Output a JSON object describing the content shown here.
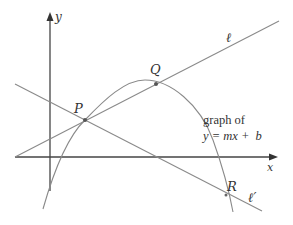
{
  "diagram": {
    "axes": {
      "x_label": "x",
      "y_label": "y"
    },
    "lines": [
      {
        "name": "line-l",
        "label": "ℓ"
      },
      {
        "name": "line-l-prime",
        "label": "ℓ′"
      }
    ],
    "curve": {
      "name": "parabola",
      "annotation_line1": "graph of",
      "annotation_line2": "y = mx +  b"
    },
    "points": [
      {
        "label": "P"
      },
      {
        "label": "Q"
      },
      {
        "label": "R"
      }
    ],
    "colors": {
      "axis": "#444444",
      "curve": "#8a8a8a",
      "text": "#333333",
      "background": "#ffffff"
    }
  }
}
